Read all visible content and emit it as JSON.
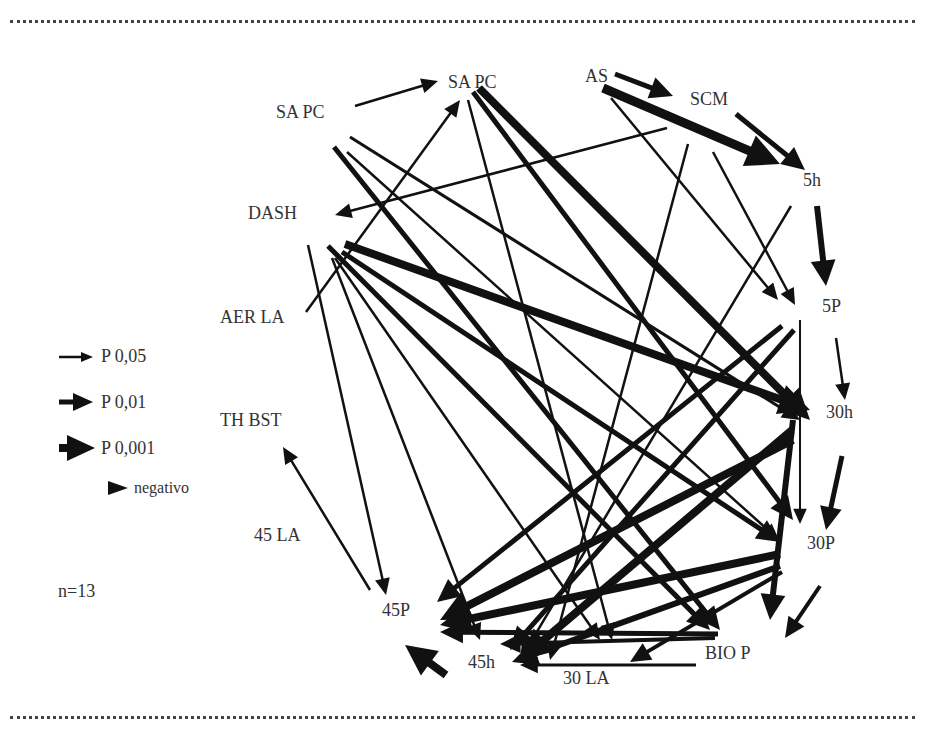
{
  "diagram": {
    "type": "path-diagram",
    "nodes": [
      {
        "id": "SAPC_top",
        "label": "SA PC",
        "x": 448,
        "y": 82
      },
      {
        "id": "AS",
        "label": "AS",
        "x": 585,
        "y": 76
      },
      {
        "id": "SCM",
        "label": "SCM",
        "x": 690,
        "y": 99
      },
      {
        "id": "SAPC_left",
        "label": "SA PC",
        "x": 276,
        "y": 112
      },
      {
        "id": "5h",
        "label": "5h",
        "x": 803,
        "y": 180
      },
      {
        "id": "DASH",
        "label": "DASH",
        "x": 248,
        "y": 213
      },
      {
        "id": "AER_LA",
        "label": "AER LA",
        "x": 220,
        "y": 317
      },
      {
        "id": "5P",
        "label": "5P",
        "x": 822,
        "y": 306
      },
      {
        "id": "30h",
        "label": "30h",
        "x": 826,
        "y": 412
      },
      {
        "id": "TH_BST",
        "label": "TH BST",
        "x": 220,
        "y": 420
      },
      {
        "id": "45LA",
        "label": "45 LA",
        "x": 254,
        "y": 535
      },
      {
        "id": "30P",
        "label": "30P",
        "x": 807,
        "y": 543
      },
      {
        "id": "45P",
        "label": "45P",
        "x": 382,
        "y": 610
      },
      {
        "id": "BIO_P",
        "label": "BIO P",
        "x": 705,
        "y": 653
      },
      {
        "id": "45h",
        "label": "45h",
        "x": 468,
        "y": 662
      },
      {
        "id": "30LA",
        "label": "30 LA",
        "x": 563,
        "y": 678
      }
    ],
    "edges": [
      {
        "x1": 355,
        "y1": 106,
        "x2": 438,
        "y2": 81,
        "w": 2.5,
        "sig": "P 0,05"
      },
      {
        "x1": 615,
        "y1": 74,
        "x2": 673,
        "y2": 96,
        "w": 5,
        "sig": "P 0,01"
      },
      {
        "x1": 603,
        "y1": 88,
        "x2": 780,
        "y2": 164,
        "w": 9,
        "sig": "P 0,001"
      },
      {
        "x1": 736,
        "y1": 114,
        "x2": 805,
        "y2": 170,
        "w": 5,
        "sig": "P 0,01"
      },
      {
        "x1": 667,
        "y1": 128,
        "x2": 335,
        "y2": 215,
        "w": 2.5,
        "sig": "P 0,05"
      },
      {
        "x1": 306,
        "y1": 312,
        "x2": 460,
        "y2": 100,
        "w": 2.5,
        "sig": "P 0,05"
      },
      {
        "x1": 817,
        "y1": 206,
        "x2": 826,
        "y2": 286,
        "w": 6,
        "sig": "P 0,01"
      },
      {
        "x1": 836,
        "y1": 338,
        "x2": 845,
        "y2": 400,
        "w": 2.5,
        "sig": "P 0,05"
      },
      {
        "x1": 842,
        "y1": 456,
        "x2": 826,
        "y2": 530,
        "w": 5,
        "sig": "P 0,01"
      },
      {
        "x1": 820,
        "y1": 586,
        "x2": 785,
        "y2": 638,
        "w": 4,
        "sig": "P 0,01"
      },
      {
        "x1": 479,
        "y1": 88,
        "x2": 810,
        "y2": 420,
        "w": 8,
        "sig": "P 0,001"
      },
      {
        "x1": 473,
        "y1": 92,
        "x2": 793,
        "y2": 520,
        "w": 5,
        "sig": "P 0,01"
      },
      {
        "x1": 468,
        "y1": 100,
        "x2": 612,
        "y2": 640,
        "w": 2.5,
        "sig": "P 0,05"
      },
      {
        "x1": 611,
        "y1": 98,
        "x2": 778,
        "y2": 300,
        "w": 2.5,
        "sig": "P 0,05"
      },
      {
        "x1": 713,
        "y1": 152,
        "x2": 795,
        "y2": 305,
        "w": 2.5,
        "sig": "P 0,05"
      },
      {
        "x1": 688,
        "y1": 144,
        "x2": 550,
        "y2": 660,
        "w": 2.5,
        "sig": "P 0,05"
      },
      {
        "x1": 791,
        "y1": 206,
        "x2": 520,
        "y2": 660,
        "w": 2.5,
        "sig": "P 0,05"
      },
      {
        "x1": 350,
        "y1": 137,
        "x2": 800,
        "y2": 420,
        "w": 3,
        "sig": "P 0,05"
      },
      {
        "x1": 347,
        "y1": 152,
        "x2": 779,
        "y2": 540,
        "w": 2.5,
        "sig": "P 0,05"
      },
      {
        "x1": 334,
        "y1": 147,
        "x2": 720,
        "y2": 630,
        "w": 5,
        "sig": "P 0,01"
      },
      {
        "x1": 345,
        "y1": 244,
        "x2": 810,
        "y2": 410,
        "w": 8,
        "sig": "P 0,001"
      },
      {
        "x1": 342,
        "y1": 252,
        "x2": 780,
        "y2": 542,
        "w": 5,
        "sig": "P 0,01"
      },
      {
        "x1": 328,
        "y1": 246,
        "x2": 710,
        "y2": 630,
        "w": 5,
        "sig": "P 0,01"
      },
      {
        "x1": 335,
        "y1": 258,
        "x2": 600,
        "y2": 640,
        "w": 2.5,
        "sig": "P 0,05"
      },
      {
        "x1": 332,
        "y1": 258,
        "x2": 480,
        "y2": 640,
        "w": 2.5,
        "sig": "P 0,05"
      },
      {
        "x1": 308,
        "y1": 245,
        "x2": 386,
        "y2": 595,
        "w": 2.5,
        "sig": "P 0,05"
      },
      {
        "x1": 370,
        "y1": 590,
        "x2": 283,
        "y2": 447,
        "w": 2.5,
        "sig": "P 0,05"
      },
      {
        "x1": 800,
        "y1": 320,
        "x2": 800,
        "y2": 524,
        "w": 2,
        "sig": "P 0,05"
      },
      {
        "x1": 782,
        "y1": 326,
        "x2": 437,
        "y2": 602,
        "w": 5,
        "sig": "P 0,01"
      },
      {
        "x1": 794,
        "y1": 330,
        "x2": 510,
        "y2": 650,
        "w": 5,
        "sig": "P 0,01"
      },
      {
        "x1": 793,
        "y1": 440,
        "x2": 440,
        "y2": 620,
        "w": 8,
        "sig": "P 0,001"
      },
      {
        "x1": 792,
        "y1": 430,
        "x2": 520,
        "y2": 660,
        "w": 8,
        "sig": "P 0,001"
      },
      {
        "x1": 793,
        "y1": 420,
        "x2": 770,
        "y2": 620,
        "w": 6,
        "sig": "P 0,01"
      },
      {
        "x1": 780,
        "y1": 554,
        "x2": 440,
        "y2": 625,
        "w": 8,
        "sig": "P 0,001"
      },
      {
        "x1": 780,
        "y1": 566,
        "x2": 512,
        "y2": 662,
        "w": 6,
        "sig": "P 0,01"
      },
      {
        "x1": 782,
        "y1": 572,
        "x2": 630,
        "y2": 662,
        "w": 4,
        "sig": "P 0,01"
      },
      {
        "x1": 718,
        "y1": 634,
        "x2": 440,
        "y2": 632,
        "w": 5,
        "sig": "P 0,01"
      },
      {
        "x1": 715,
        "y1": 638,
        "x2": 500,
        "y2": 644,
        "w": 4,
        "sig": "P 0,01"
      },
      {
        "x1": 696,
        "y1": 665,
        "x2": 520,
        "y2": 665,
        "w": 3,
        "sig": "P 0,05"
      },
      {
        "x1": 446,
        "y1": 675,
        "x2": 405,
        "y2": 645,
        "w": 8,
        "sig": "P 0,001"
      }
    ]
  },
  "legend": {
    "items": [
      {
        "label": "P 0,05",
        "size": "thin"
      },
      {
        "label": "P 0,01",
        "size": "medium"
      },
      {
        "label": "P 0,001",
        "size": "thick"
      },
      {
        "label": "negativo",
        "size": "head-only"
      }
    ]
  },
  "sample": {
    "label": "n=13"
  },
  "colors": {
    "arrow": "#111111",
    "text": "#333333",
    "rule": "#444444",
    "background": "#ffffff"
  }
}
